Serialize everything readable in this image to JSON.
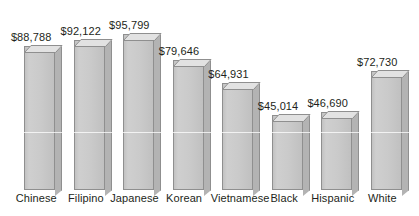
{
  "chart_data": {
    "type": "bar",
    "title": "",
    "subtitle": "",
    "xlabel": "",
    "ylabel": "",
    "grid": false,
    "legend": "none",
    "axis_visible": false,
    "value_prefix": "$",
    "ylim": [
      0,
      95799
    ],
    "categories": [
      "Chinese",
      "Filipino",
      "Japanese",
      "Korean",
      "Vietnamese",
      "Black",
      "Hispanic",
      "White"
    ],
    "values": [
      88788,
      92122,
      95799,
      79646,
      64931,
      45014,
      46690,
      72730
    ],
    "value_labels": [
      "$88,788",
      "$92,122",
      "$95,799",
      "$79,646",
      "$64,931",
      "$45,014",
      "$46,690",
      "$72,730"
    ],
    "series": [
      {
        "name": "Median household income",
        "values": [
          88788,
          92122,
          95799,
          79646,
          64931,
          45014,
          46690,
          72730
        ]
      }
    ],
    "colors": {
      "bar_front": "#cacaca",
      "bar_side": "#b3b3b3",
      "bar_top": "#e2e2e2",
      "bar_edge": "#8f8f8f",
      "text": "#231f20",
      "background": "#ffffff"
    }
  },
  "bars": [
    {
      "label": "Chinese",
      "value_label": "$88,788",
      "left": 24,
      "width": 31,
      "height": 144,
      "label_left": 10,
      "label_top": 31,
      "cat_left": 4,
      "cat_width": 62
    },
    {
      "label": "Filipino",
      "value_label": "$92,122",
      "left": 77,
      "width": 31,
      "height": 150,
      "label_left": 63,
      "label_top": 25,
      "cat_left": 57,
      "cat_width": 62
    },
    {
      "label": "Japanese",
      "value_label": "$95,799",
      "left": 130,
      "width": 31,
      "height": 156,
      "label_left": 115,
      "label_top": 19,
      "cat_left": 109,
      "cat_width": 62
    },
    {
      "label": "Korean",
      "value_label": "$79,646",
      "left": 183,
      "width": 31,
      "height": 130,
      "label_left": 168,
      "label_top": 45,
      "cat_left": 162,
      "cat_width": 62
    },
    {
      "label": "Vietnamese",
      "value_label": "$64,931",
      "left": 236,
      "width": 31,
      "height": 107,
      "label_left": 221,
      "label_top": 68,
      "cat_left": 208,
      "cat_width": 88
    },
    {
      "label": "Black",
      "value_label": "$45,014",
      "left": 289,
      "width": 31,
      "height": 75,
      "label_left": 274,
      "label_top": 100,
      "cat_left": 269,
      "cat_width": 62
    },
    {
      "label": "Hispanic",
      "value_label": "$46,690",
      "left": 342,
      "width": 31,
      "height": 78,
      "label_left": 327,
      "label_top": 97,
      "cat_left": 321,
      "cat_width": 62
    },
    {
      "label": "White",
      "value_label": "$72,730",
      "left": 395,
      "width": 31,
      "height": 119,
      "label_left": 380,
      "label_top": 56,
      "cat_left": 374,
      "cat_width": 62
    }
  ]
}
